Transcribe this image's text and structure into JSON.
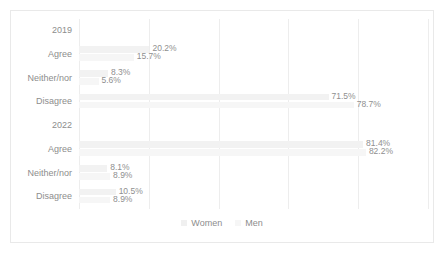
{
  "chart_data": {
    "type": "bar",
    "orientation": "horizontal",
    "title": "",
    "subtitle": "",
    "xlabel": "",
    "ylabel": "",
    "xlim": [
      0,
      100
    ],
    "xticks": [
      0,
      20,
      40,
      60,
      80,
      100
    ],
    "grid": true,
    "legend_position": "bottom",
    "legend": [
      "Women",
      "Men"
    ],
    "series": [
      {
        "name": "Women",
        "color": "#f2f2f2",
        "values": [
          null,
          20.2,
          8.3,
          71.5,
          null,
          81.4,
          8.1,
          10.5
        ]
      },
      {
        "name": "Men",
        "color": "#f6f6f6",
        "values": [
          null,
          15.7,
          5.6,
          78.7,
          null,
          82.2,
          8.9,
          8.9
        ]
      }
    ],
    "categories": [
      "2019",
      "Agree",
      "Neither/nor",
      "Disagree",
      "2022",
      "Agree",
      "Neither/nor",
      "Disagree"
    ],
    "rows": [
      {
        "label": "2019",
        "is_group": true,
        "women": null,
        "men": null,
        "women_label": "",
        "men_label": ""
      },
      {
        "label": "Agree",
        "is_group": false,
        "women": 20.2,
        "men": 15.7,
        "women_label": "20.2%",
        "men_label": "15.7%"
      },
      {
        "label": "Neither/nor",
        "is_group": false,
        "women": 8.3,
        "men": 5.6,
        "women_label": "8.3%",
        "men_label": "5.6%"
      },
      {
        "label": "Disagree",
        "is_group": false,
        "women": 71.5,
        "men": 78.7,
        "women_label": "71.5%",
        "men_label": "78.7%"
      },
      {
        "label": "2022",
        "is_group": true,
        "women": null,
        "men": null,
        "women_label": "",
        "men_label": ""
      },
      {
        "label": "Agree",
        "is_group": false,
        "women": 81.4,
        "men": 82.2,
        "women_label": "81.4%",
        "men_label": "82.2%"
      },
      {
        "label": "Neither/nor",
        "is_group": false,
        "women": 8.1,
        "men": 8.9,
        "women_label": "8.1%",
        "men_label": "8.9%"
      },
      {
        "label": "Disagree",
        "is_group": false,
        "women": 10.5,
        "men": 8.9,
        "women_label": "10.5%",
        "men_label": "8.9%"
      }
    ]
  },
  "colors": {
    "women": "#f2f2f2",
    "men": "#f6f6f6",
    "gridline": "#ededed",
    "border": "#e9e9e9",
    "text": "#8d8d8d"
  }
}
